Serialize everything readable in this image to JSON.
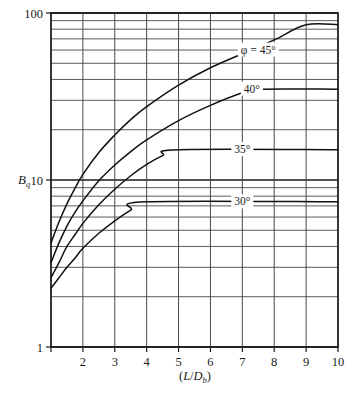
{
  "chart_data": {
    "type": "line",
    "title": "",
    "subtitle": "",
    "xlabel": "(L/D_b)",
    "xlabel_parts": {
      "open": "(",
      "L": "L",
      "slash": "/",
      "D": "D",
      "sub": "b",
      "close": ")"
    },
    "ylabel": "B_q",
    "ylabel_parts": {
      "main": "B",
      "sub": "q"
    },
    "xscale": "linear",
    "yscale": "log",
    "xlim": [
      1,
      10
    ],
    "ylim": [
      1,
      100
    ],
    "grid": true,
    "grid_style": "log-minor-horizontal-and-linear-vertical",
    "xticks": [
      1,
      2,
      3,
      4,
      5,
      6,
      7,
      8,
      9,
      10
    ],
    "xtick_labels": [
      "",
      "2",
      "3",
      "4",
      "5",
      "6",
      "7",
      "8",
      "9",
      "10"
    ],
    "yticks": [
      1,
      10,
      100
    ],
    "ytick_labels": [
      "1",
      "10",
      "100"
    ],
    "y_minor_ticks": [
      2,
      3,
      4,
      5,
      6,
      7,
      8,
      9,
      20,
      30,
      40,
      50,
      60,
      70,
      80,
      90
    ],
    "legend_position": "inline-annotations",
    "series": [
      {
        "name": "phi = 45",
        "label": "φ = 45°",
        "label_x": 7.5,
        "label_y": 60,
        "points": [
          {
            "x": 1.0,
            "y": 4.2
          },
          {
            "x": 1.25,
            "y": 5.6
          },
          {
            "x": 1.5,
            "y": 7.2
          },
          {
            "x": 1.75,
            "y": 8.9
          },
          {
            "x": 2.0,
            "y": 10.8
          },
          {
            "x": 2.5,
            "y": 14.6
          },
          {
            "x": 3.0,
            "y": 18.6
          },
          {
            "x": 3.5,
            "y": 23.0
          },
          {
            "x": 4.0,
            "y": 27.5
          },
          {
            "x": 5.0,
            "y": 37.0
          },
          {
            "x": 6.0,
            "y": 47.0
          },
          {
            "x": 7.0,
            "y": 57.0
          },
          {
            "x": 8.0,
            "y": 69.0
          },
          {
            "x": 9.0,
            "y": 85.0
          },
          {
            "x": 10.0,
            "y": 85.0
          }
        ]
      },
      {
        "name": "phi = 40",
        "label": "40°",
        "label_x": 7.3,
        "label_y": 35,
        "points": [
          {
            "x": 1.0,
            "y": 3.2
          },
          {
            "x": 1.25,
            "y": 4.2
          },
          {
            "x": 1.5,
            "y": 5.3
          },
          {
            "x": 1.75,
            "y": 6.4
          },
          {
            "x": 2.0,
            "y": 7.5
          },
          {
            "x": 2.5,
            "y": 9.9
          },
          {
            "x": 3.0,
            "y": 12.3
          },
          {
            "x": 3.5,
            "y": 14.8
          },
          {
            "x": 4.0,
            "y": 17.4
          },
          {
            "x": 5.0,
            "y": 22.7
          },
          {
            "x": 6.0,
            "y": 28.0
          },
          {
            "x": 7.0,
            "y": 33.3
          },
          {
            "x": 7.5,
            "y": 35.0
          },
          {
            "x": 10.0,
            "y": 35.0
          }
        ]
      },
      {
        "name": "phi = 35",
        "label": "35°",
        "label_x": 7.0,
        "label_y": 15.2,
        "points": [
          {
            "x": 1.0,
            "y": 2.6
          },
          {
            "x": 1.25,
            "y": 3.2
          },
          {
            "x": 1.5,
            "y": 4.0
          },
          {
            "x": 1.75,
            "y": 4.7
          },
          {
            "x": 2.0,
            "y": 5.5
          },
          {
            "x": 2.5,
            "y": 7.1
          },
          {
            "x": 3.0,
            "y": 8.8
          },
          {
            "x": 3.5,
            "y": 10.6
          },
          {
            "x": 4.0,
            "y": 12.4
          },
          {
            "x": 4.5,
            "y": 14.0
          },
          {
            "x": 5.0,
            "y": 15.2
          },
          {
            "x": 10.0,
            "y": 15.2
          }
        ]
      },
      {
        "name": "phi = 30",
        "label": "30°",
        "label_x": 7.0,
        "label_y": 7.4,
        "points": [
          {
            "x": 1.0,
            "y": 2.25
          },
          {
            "x": 1.25,
            "y": 2.6
          },
          {
            "x": 1.5,
            "y": 3.0
          },
          {
            "x": 1.75,
            "y": 3.4
          },
          {
            "x": 2.0,
            "y": 3.9
          },
          {
            "x": 2.5,
            "y": 4.8
          },
          {
            "x": 3.0,
            "y": 5.7
          },
          {
            "x": 3.5,
            "y": 6.6
          },
          {
            "x": 4.0,
            "y": 7.4
          },
          {
            "x": 10.0,
            "y": 7.4
          }
        ]
      }
    ],
    "annotations": [
      {
        "text": "φ = 45°",
        "x": 7.5,
        "y": 60
      },
      {
        "text": "40°",
        "x": 7.3,
        "y": 35
      },
      {
        "text": "35°",
        "x": 7.0,
        "y": 15.2
      },
      {
        "text": "30°",
        "x": 7.0,
        "y": 7.4
      }
    ],
    "colors": {
      "curve": "#111111",
      "grid": "#4a4a4a",
      "axis": "#1a1a1a",
      "background": "#ffffff"
    }
  }
}
